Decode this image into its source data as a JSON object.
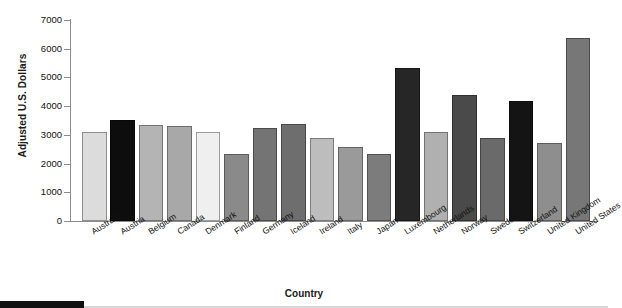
{
  "chart_data": {
    "type": "bar",
    "title": "",
    "xlabel": "Country",
    "ylabel": "Adjusted U.S. Dollars",
    "ylim": [
      0,
      7000
    ],
    "yticks": [
      0,
      1000,
      2000,
      3000,
      4000,
      5000,
      6000,
      7000
    ],
    "grid": false,
    "legend": "none",
    "categories": [
      "Australia",
      "Austria",
      "Belgium",
      "Canada",
      "Denmark",
      "Finland",
      "Germany",
      "Iceland",
      "Ireland",
      "Italy",
      "Japan",
      "Luxembourg",
      "Netherlands",
      "Norway",
      "Sweden",
      "Switzerland",
      "United Kingdom",
      "United States"
    ],
    "values": [
      3100,
      3520,
      3360,
      3300,
      3090,
      2330,
      3240,
      3390,
      2900,
      2580,
      2330,
      5330,
      3090,
      4390,
      2900,
      4180,
      2730,
      6380
    ],
    "bar_colors": [
      "#dcdcdc",
      "#0d0d0d",
      "#b4b4b4",
      "#a8a8a8",
      "#efefef",
      "#8a8a8a",
      "#747474",
      "#6e6e6e",
      "#bdbdbd",
      "#9a9a9a",
      "#7c7c7c",
      "#262626",
      "#b0b0b0",
      "#4a4a4a",
      "#6a6a6a",
      "#141414",
      "#8e8e8e",
      "#777777"
    ]
  },
  "axis": {
    "tick_labels": [
      "7000",
      "6000",
      "5000",
      "4000",
      "3000",
      "2000",
      "1000",
      "0"
    ]
  }
}
